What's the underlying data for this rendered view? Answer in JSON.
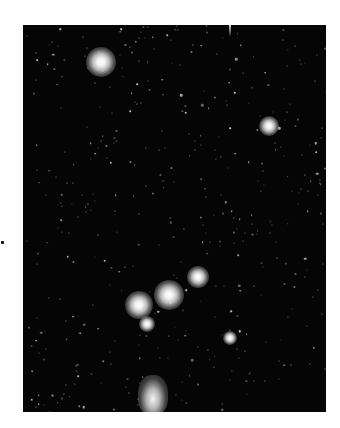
{
  "image": {
    "subject": "star field photograph",
    "background_color": "#050505",
    "frame": {
      "left": 23,
      "top": 25,
      "width": 303,
      "height": 387
    }
  },
  "bright_stars": [
    {
      "name": "bright-star-top-left",
      "x": 78,
      "y": 37,
      "size": 30
    },
    {
      "name": "bright-star-right",
      "x": 246,
      "y": 101,
      "size": 20
    },
    {
      "name": "bright-star-cluster-upper",
      "x": 175,
      "y": 252,
      "size": 22
    },
    {
      "name": "bright-star-cluster-center",
      "x": 146,
      "y": 270,
      "size": 30
    },
    {
      "name": "bright-star-cluster-left",
      "x": 116,
      "y": 280,
      "size": 28
    },
    {
      "name": "bright-star-cluster-lower",
      "x": 124,
      "y": 299,
      "size": 16
    },
    {
      "name": "bright-star-lower-right",
      "x": 207,
      "y": 313,
      "size": 14
    }
  ],
  "nebula": [
    {
      "name": "nebula-bottom",
      "x": 130,
      "y": 370,
      "w": 30,
      "h": 40
    }
  ],
  "streaks": [
    {
      "name": "streak-top",
      "x": 206,
      "y": 0
    }
  ],
  "small_star_count": 420
}
